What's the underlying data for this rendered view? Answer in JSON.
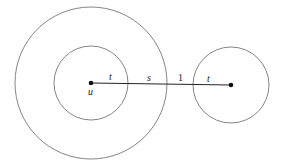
{
  "diagram": {
    "colors": {
      "stroke": "#555555",
      "line": "#222222",
      "dot": "#111111",
      "background": "#ffffff"
    },
    "left_center": {
      "label": "u",
      "x": 91,
      "y": 83
    },
    "right_center": {
      "label": "",
      "x": 231,
      "y": 85
    },
    "circles": [
      {
        "name": "outer-circle-u",
        "cx": 91,
        "cy": 83,
        "r": 76
      },
      {
        "name": "inner-circle-u",
        "cx": 91,
        "cy": 83,
        "r": 37
      },
      {
        "name": "circle-right",
        "cx": 231,
        "cy": 85,
        "r": 38
      }
    ],
    "segment_labels": [
      {
        "name": "label-t-left",
        "text": "t",
        "x": 111,
        "y": 80,
        "italic": true
      },
      {
        "name": "label-s",
        "text": "s",
        "x": 149,
        "y": 81,
        "italic": true
      },
      {
        "name": "label-1",
        "text": "1",
        "x": 180,
        "y": 81,
        "italic": false
      },
      {
        "name": "label-t-right",
        "text": "t",
        "x": 209,
        "y": 81,
        "italic": true
      }
    ],
    "point_label_u": "u"
  }
}
